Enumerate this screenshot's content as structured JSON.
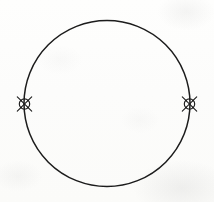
{
  "figure": {
    "kind": "line-drawing",
    "title": "Circle with two opposed node markers",
    "canvas": {
      "width": 214,
      "height": 202
    },
    "background_color": "#fdfdfc",
    "stroke_color": "#1c1c1c",
    "texture": "scanned paper with faint grey smudges"
  },
  "circle": {
    "label": "main-circle",
    "center_x": 107,
    "center_y": 103.5,
    "radius": 83,
    "stroke_width": 1.5,
    "fill": "none",
    "stroke_color": "#1c1c1c"
  },
  "markers": [
    {
      "label": "left-node-marker",
      "position": "left",
      "center_x": 24.5,
      "center_y": 104,
      "ring_radius": 5.2,
      "spoke_length": 10,
      "inner_symbol": "x-cross",
      "spoke_count": 4,
      "stroke_width": 1.1,
      "stroke_color": "#1c1c1c"
    },
    {
      "label": "right-node-marker",
      "position": "right",
      "center_x": 189.5,
      "center_y": 104,
      "ring_radius": 5.2,
      "spoke_length": 10,
      "inner_symbol": "x-cross",
      "spoke_count": 4,
      "stroke_width": 1.1,
      "stroke_color": "#1c1c1c"
    }
  ]
}
